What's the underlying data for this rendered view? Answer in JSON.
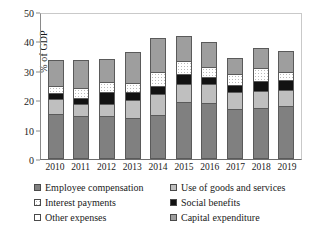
{
  "chart_data": {
    "type": "bar",
    "subtype": "stacked-bar",
    "title": "",
    "xlabel": "",
    "ylabel": "% of GDP",
    "ylim": [
      0,
      50
    ],
    "ytick_labels": [
      "0",
      "10",
      "20",
      "30",
      "40",
      "50"
    ],
    "yticks": [
      0,
      10,
      20,
      30,
      40,
      50
    ],
    "grid": false,
    "legend_position": "bottom",
    "categories": [
      "2010",
      "2011",
      "2012",
      "2013",
      "2014",
      "2015",
      "2016",
      "2017",
      "2018",
      "2019"
    ],
    "series": [
      {
        "name": "Employee compensation",
        "color": "#808080",
        "values": [
          14.7,
          13.9,
          13.9,
          13.4,
          14.2,
          18.7,
          18.4,
          16.5,
          16.6,
          17.3
        ]
      },
      {
        "name": "Use of goods and services",
        "color": "#bfbfbf",
        "values": [
          5.1,
          4.2,
          4.0,
          6.0,
          7.2,
          6.3,
          6.6,
          5.7,
          5.9,
          5.4
        ]
      },
      {
        "name": "Social benefits",
        "color": "#121212",
        "values": [
          2.1,
          2.0,
          4.3,
          2.8,
          2.8,
          3.2,
          2.1,
          2.2,
          3.2,
          3.4
        ]
      },
      {
        "name": "Interest payments",
        "color": "#ffffff",
        "values": [
          2.1,
          3.4,
          3.2,
          3.1,
          4.9,
          4.3,
          3.4,
          3.9,
          4.6,
          2.8
        ]
      },
      {
        "name": "Other expenses",
        "color": "#ffffff",
        "values": [
          0.0,
          0.0,
          0.0,
          0.0,
          0.0,
          0.0,
          0.0,
          0.0,
          0.0,
          0.0
        ]
      },
      {
        "name": "Capital expenditure",
        "color": "#9e9e9e",
        "values": [
          9.0,
          9.5,
          7.9,
          10.3,
          11.5,
          8.6,
          8.5,
          5.3,
          6.7,
          7.1
        ]
      }
    ],
    "totals": [
      33.0,
      33.0,
      33.3,
      35.6,
      40.6,
      41.1,
      39.0,
      33.6,
      37.0,
      36.0
    ]
  },
  "axes": {
    "y_title": "% of GDP",
    "y_ticks": [
      {
        "label": "50",
        "value": 50
      },
      {
        "label": "40",
        "value": 40
      },
      {
        "label": "30",
        "value": 30
      },
      {
        "label": "20",
        "value": 20
      },
      {
        "label": "10",
        "value": 10
      },
      {
        "label": "0",
        "value": 0
      }
    ],
    "x_ticks": [
      "2010",
      "2011",
      "2012",
      "2013",
      "2014",
      "2015",
      "2016",
      "2017",
      "2018",
      "2019"
    ]
  },
  "legend": {
    "entries": [
      {
        "label": "Employee compensation",
        "key": "employee",
        "color": "#808080"
      },
      {
        "label": "Use of goods and services",
        "key": "goods",
        "color": "#bfbfbf"
      },
      {
        "label": "Interest payments",
        "key": "interest",
        "color": "#ffffff"
      },
      {
        "label": "Social benefits",
        "key": "social",
        "color": "#121212"
      },
      {
        "label": "Other expenses",
        "key": "other",
        "color": "#ffffff"
      },
      {
        "label": "Capital expenditure",
        "key": "capital",
        "color": "#9e9e9e"
      }
    ]
  }
}
